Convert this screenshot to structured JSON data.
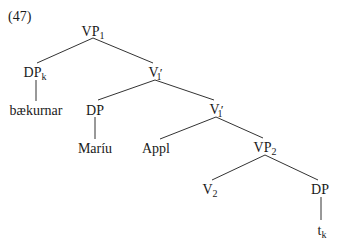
{
  "example_number": "(47)",
  "tree": {
    "nodes": [
      {
        "id": "vp1",
        "label": "VP",
        "sub": "1",
        "prime": "",
        "x": 93,
        "y": 25
      },
      {
        "id": "dpk",
        "label": "DP",
        "sub": "k",
        "prime": "",
        "x": 35,
        "y": 66
      },
      {
        "id": "v1bar_a",
        "label": "V",
        "sub": "1",
        "prime": "′",
        "x": 155,
        "y": 66
      },
      {
        "id": "baekurnar",
        "label": "bækurnar",
        "sub": "",
        "prime": "",
        "x": 36,
        "y": 104
      },
      {
        "id": "dp_mariu",
        "label": "DP",
        "sub": "",
        "prime": "",
        "x": 95,
        "y": 104
      },
      {
        "id": "v1bar_b",
        "label": "V",
        "sub": "1",
        "prime": "′",
        "x": 216,
        "y": 103
      },
      {
        "id": "mariu",
        "label": "Maríu",
        "sub": "",
        "prime": "",
        "x": 95,
        "y": 142
      },
      {
        "id": "appl",
        "label": "Appl",
        "sub": "",
        "prime": "",
        "x": 156,
        "y": 142
      },
      {
        "id": "vp2",
        "label": "VP",
        "sub": "2",
        "prime": "",
        "x": 265,
        "y": 141
      },
      {
        "id": "v2",
        "label": "V",
        "sub": "2",
        "prime": "",
        "x": 210,
        "y": 183
      },
      {
        "id": "dp_low",
        "label": "DP",
        "sub": "",
        "prime": "",
        "x": 320,
        "y": 183
      },
      {
        "id": "tk",
        "label": "t",
        "sub": "k",
        "prime": "",
        "x": 322,
        "y": 224
      }
    ],
    "edges": [
      [
        93,
        38,
        37,
        63
      ],
      [
        93,
        38,
        153,
        63
      ],
      [
        36,
        80,
        36,
        101
      ],
      [
        155,
        80,
        98,
        100
      ],
      [
        155,
        80,
        214,
        100
      ],
      [
        95,
        117,
        95,
        139
      ],
      [
        216,
        117,
        160,
        139
      ],
      [
        216,
        117,
        263,
        138
      ],
      [
        265,
        155,
        212,
        180
      ],
      [
        265,
        155,
        318,
        180
      ],
      [
        321,
        197,
        321,
        220
      ]
    ]
  }
}
